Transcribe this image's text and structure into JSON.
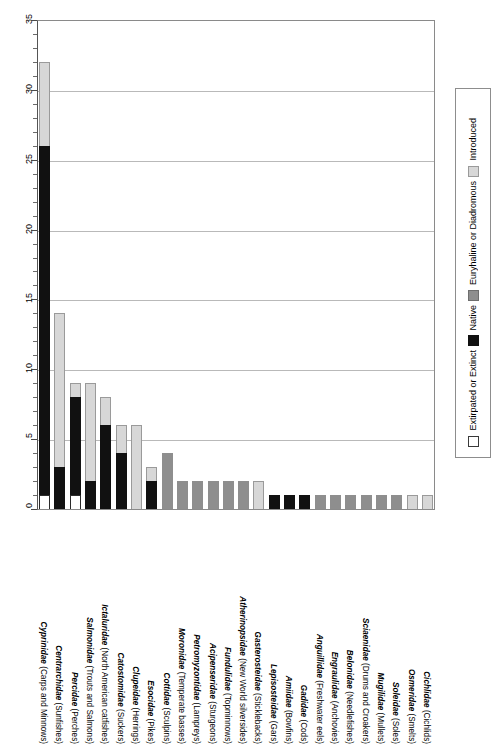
{
  "chart_data": {
    "type": "bar",
    "title": "",
    "subtitle": "",
    "xlabel": "",
    "ylabel": "",
    "ylim": [
      0,
      35
    ],
    "ytick_interval": 5,
    "yminor_interval": 1,
    "ytick_labels": [
      "0",
      "5",
      "10",
      "15",
      "20",
      "25",
      "30",
      "35"
    ],
    "grid": true,
    "stacked": true,
    "legend_position": "right",
    "orientation": "vertical",
    "categories": [
      "Cyprinidae (Carps and Minnows)",
      "Centrarchidae (Sunfishes)",
      "Percidae (Perches)",
      "Salmonidae (Trouts and Salmons)",
      "Ictaluridae (North American catfishes)",
      "Catostomidae (Suckers)",
      "Clupeidae (Herrings)",
      "Esocidae (Pikes)",
      "Cottidae (Sculpins)",
      "Moronidae (Temperate basses)",
      "Petromyzontidae (Lampreys)",
      "Acipenseridae (Sturgeons)",
      "Fundulidae (Topminnows)",
      "Atherinopsidae (New World silversides)",
      "Gasterosteidae (Sticklebacks)",
      "Lepisosteidae (Gars)",
      "Amiidae (Bowfins)",
      "Gadidae (Cods)",
      "Anguillidae (Freshwater eels)",
      "Engraulidae (Anchovies)",
      "Belonidae (Needlefishes)",
      "Sciaenidae (Drums and Croakers)",
      "Mugilidae (Mullets)",
      "Soleidae (Soles)",
      "Osmeridae (Smelts)",
      "Cichlidae (Cichlids)"
    ],
    "category_families": [
      "Cyprinidae",
      "Centrarchidae",
      "Percidae",
      "Salmonidae",
      "Ictaluridae",
      "Catostomidae",
      "Clupeidae",
      "Esocidae",
      "Cottidae",
      "Moronidae",
      "Petromyzontidae",
      "Acipenseridae",
      "Fundulidae",
      "Atherinopsidae",
      "Gasterosteidae",
      "Lepisosteidae",
      "Amiidae",
      "Gadidae",
      "Anguillidae",
      "Engraulidae",
      "Belonidae",
      "Sciaenidae",
      "Mugilidae",
      "Soleidae",
      "Osmeridae",
      "Cichlidae"
    ],
    "category_common": [
      "(Carps and Minnows)",
      "(Sunfishes)",
      "(Perches)",
      "(Trouts and Salmons)",
      "(North American catfishes)",
      "(Suckers)",
      "(Herrings)",
      "(Pikes)",
      "(Sculpins)",
      "(Temperate basses)",
      "(Lampreys)",
      "(Sturgeons)",
      "(Topminnows)",
      "(New World silversides)",
      "(Sticklebacks)",
      "(Gars)",
      "(Bowfins)",
      "(Cods)",
      "(Freshwater eels)",
      "(Anchovies)",
      "(Needlefishes)",
      "(Drums and Croakers)",
      "(Mullets)",
      "(Soles)",
      "(Smelts)",
      "(Cichlids)"
    ],
    "series": [
      {
        "name": "Extirpated or Extinct",
        "color": "#ffffff",
        "values": [
          1,
          0,
          1,
          0,
          0,
          0,
          0,
          0,
          0,
          0,
          0,
          0,
          0,
          0,
          0,
          0,
          0,
          0,
          0,
          0,
          0,
          0,
          0,
          0,
          0,
          0
        ]
      },
      {
        "name": "Native",
        "color": "#111111",
        "values": [
          25,
          3,
          7,
          2,
          6,
          4,
          0,
          2,
          0,
          0,
          0,
          0,
          0,
          0,
          0,
          1,
          1,
          1,
          0,
          0,
          0,
          0,
          0,
          0,
          0,
          0
        ]
      },
      {
        "name": "Euryhaline or Diadromous",
        "color": "#8e8e8e",
        "values": [
          0,
          0,
          0,
          0,
          0,
          0,
          0,
          0,
          4,
          2,
          2,
          2,
          2,
          2,
          0,
          0,
          0,
          0,
          1,
          1,
          1,
          1,
          1,
          1,
          0,
          0
        ]
      },
      {
        "name": "Introduced",
        "color": "#d7d7d7",
        "values": [
          6,
          11,
          1,
          7,
          2,
          2,
          6,
          1,
          0,
          0,
          0,
          0,
          0,
          0,
          2,
          0,
          0,
          0,
          0,
          0,
          0,
          0,
          0,
          0,
          1,
          1
        ]
      }
    ],
    "totals": [
      32,
      14,
      9,
      9,
      8,
      6,
      6,
      3,
      4,
      2,
      2,
      2,
      2,
      2,
      2,
      1,
      1,
      1,
      1,
      1,
      1,
      1,
      1,
      1,
      1,
      1
    ]
  },
  "legend": {
    "items": [
      {
        "label": "Extirpated or Extinct",
        "swatch": "extirpated"
      },
      {
        "label": "Native",
        "swatch": "native"
      },
      {
        "label": "Euryhaline or Diadromous",
        "swatch": "eury"
      },
      {
        "label": "Introduced",
        "swatch": "intro"
      }
    ]
  },
  "colors": {
    "extirpated": "#ffffff",
    "native": "#111111",
    "euryhaline": "#8e8e8e",
    "introduced": "#d7d7d7",
    "gridline": "#b9b9b9",
    "frame": "#8a8a8a"
  }
}
